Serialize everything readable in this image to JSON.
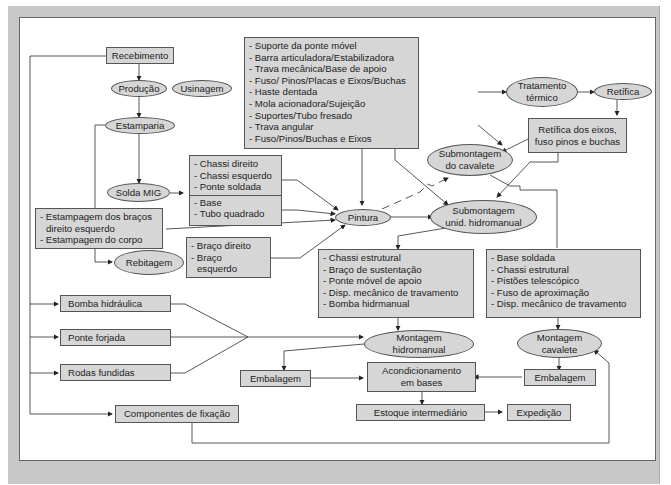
{
  "diagram": {
    "nodes": {
      "recebimento": "Recebimento",
      "producao": "Produção",
      "usinagem": "Usinagem",
      "estamparia": "Estamparia",
      "solda_mig": "Solda MIG",
      "rebitagem": "Rebitagem",
      "pintura": "Pintura",
      "tratamento_termico_1": "Tratamento",
      "tratamento_termico_2": "térmico",
      "retifica": "Retífica",
      "retifica_box_1": "Retífica dos eixos,",
      "retifica_box_2": "fuso pinos e buchas",
      "sub_cavalete_1": "Submontagem",
      "sub_cavalete_2": "do cavalete",
      "sub_hidro_1": "Submontagem",
      "sub_hidro_2": "unid. hidromanual",
      "bomba_hidraulica": "Bomba hidráulica",
      "ponte_forjada": "Ponte forjada",
      "rodas_fundidas": "Rodas fundidas",
      "componentes_fixacao": "Componentes de fixação",
      "montagem_hidro_1": "Montagem",
      "montagem_hidro_2": "hidromanual",
      "montagem_cav_1": "Montagem",
      "montagem_cav_2": "cavalete",
      "embalagem_left": "Embalagem",
      "embalagem_right": "Embalagem",
      "acondicionamento_1": "Acondicionamento",
      "acondicionamento_2": "em bases",
      "estoque": "Estoque intermediário",
      "expedicao": "Expedição"
    },
    "lists": {
      "usinagem_parts": [
        "- Suporte da ponte móvel",
        "- Barra articuladora/Estabilizadora",
        "- Trava mecânica/Base de apoio",
        "- Fuso/ Pinos/Placas e Eixos/Buchas",
        "- Haste dentada",
        "- Mola acionadora/Sujeição",
        "- Suportes/Tubo fresado",
        "- Trava angular",
        "- Fuso/Pinos/Buchas e Eixos"
      ],
      "solda_parts_a": [
        "- Chassi direito",
        "- Chassi esquerdo",
        "- Ponte soldada"
      ],
      "solda_parts_b": [
        "- Base",
        "- Tubo quadrado"
      ],
      "estampagem": [
        "- Estampagem dos braços",
        "  direito esquerdo",
        "- Estampagem do corpo"
      ],
      "rebitagem_parts": [
        "- Braço direito",
        "- Braço",
        "  esquerdo"
      ],
      "hidro_parts": [
        "- Chassi estrutural",
        "- Braço de sustentação",
        "- Ponte móvel de apoio",
        "- Disp. mecânico de travamento",
        "- Bomba hidrmanual"
      ],
      "cavalete_parts": [
        "- Base soldada",
        "- Chassi estrutural",
        "- Pistões telescópico",
        "- Fuso de aproximação",
        "- Disp. mecânico de travamento"
      ]
    },
    "colors": {
      "node_fill": "#d6d6d6",
      "stroke": "#555555",
      "frame": "#c8c8c8"
    }
  }
}
